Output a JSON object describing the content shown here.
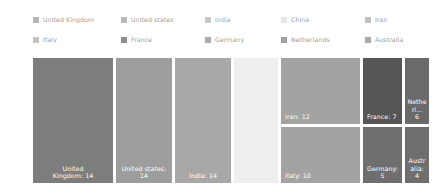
{
  "chart_data": {
    "type": "treemap",
    "title": "",
    "xlabel": "",
    "ylabel": "",
    "legend_position": "top",
    "grid": false,
    "categories": [
      "United Kingdom",
      "United states",
      "India",
      "China",
      "Iran",
      "Italy",
      "France",
      "Germany",
      "Netherlands",
      "Australia"
    ],
    "values": [
      14,
      14,
      14,
      14,
      12,
      10,
      7,
      5,
      6,
      4
    ],
    "labels": [
      "United Kingdom: 14",
      "United states: 14",
      "India: 14",
      "China: 14",
      "Iran: 12",
      "Italy: 10",
      "France: 7",
      "Germany: 5",
      "Netherl... 6",
      "Australia: 4"
    ],
    "colors": [
      "#7d7d7d",
      "#9d9d9d",
      "#a8a8a8",
      "#eeeeee",
      "#a3a3a3",
      "#a3a3a3",
      "#555555",
      "#6e6e6e",
      "#6a6a6a",
      "#6e6e6e"
    ]
  },
  "legend": {
    "rows": [
      [
        {
          "label": "United Kingdom",
          "color": "#b6b6b6"
        },
        {
          "label": "United states",
          "color": "#b9b9b9"
        },
        {
          "label": "India",
          "color": "#c9c9c9"
        },
        {
          "label": "China",
          "color": "#e8e8e8"
        },
        {
          "label": "Iran",
          "color": "#c0c0c0"
        }
      ],
      [
        {
          "label": "Italy",
          "color": "#c4c4c4"
        },
        {
          "label": "France",
          "color": "#8e8e8e"
        },
        {
          "label": "Germany",
          "color": "#ababab"
        },
        {
          "label": "Netherlands",
          "color": "#a0a0a0"
        },
        {
          "label": "Australia",
          "color": "#aaaaaa"
        }
      ]
    ]
  },
  "tiles": [
    {
      "name": "united-kingdom",
      "label_line1": "United",
      "label_line2": "Kingdom: 14",
      "color": "#7d7d7d",
      "x": 0,
      "y": 0,
      "w": 80,
      "h": 125
    },
    {
      "name": "united-states",
      "label_line1": "United states:",
      "label_line2": "14",
      "color": "#9d9d9d",
      "x": 83,
      "y": 0,
      "w": 56,
      "h": 125
    },
    {
      "name": "india",
      "label_line1": "India: 14",
      "label_line2": "",
      "color": "#a8a8a8",
      "x": 142,
      "y": 0,
      "w": 56,
      "h": 125
    },
    {
      "name": "china",
      "label_line1": "China: 14",
      "label_line2": "",
      "color": "#eeeeee",
      "x": 201,
      "y": 0,
      "w": 44,
      "h": 125
    },
    {
      "name": "iran",
      "label_line1": "Iran: 12",
      "label_line2": "",
      "color": "#a3a3a3",
      "x": 248,
      "y": 0,
      "w": 79,
      "h": 66
    },
    {
      "name": "italy",
      "label_line1": "Italy: 10",
      "label_line2": "",
      "color": "#a3a3a3",
      "x": 248,
      "y": 69,
      "w": 79,
      "h": 56
    },
    {
      "name": "france",
      "label_line1": "France: 7",
      "label_line2": "",
      "color": "#555555",
      "x": 330,
      "y": 0,
      "w": 39,
      "h": 66
    },
    {
      "name": "germany",
      "label_line1": "Germany: 5",
      "label_line2": "",
      "color": "#6e6e6e",
      "x": 330,
      "y": 69,
      "w": 39,
      "h": 56
    },
    {
      "name": "netherlands",
      "label_line1": "Netherl...",
      "label_line2": "6",
      "color": "#6a6a6a",
      "x": 372,
      "y": 0,
      "w": 24,
      "h": 66
    },
    {
      "name": "australia",
      "label_line1": "Australia:",
      "label_line2": "4",
      "color": "#6e6e6e",
      "x": 372,
      "y": 69,
      "w": 24,
      "h": 56
    }
  ]
}
